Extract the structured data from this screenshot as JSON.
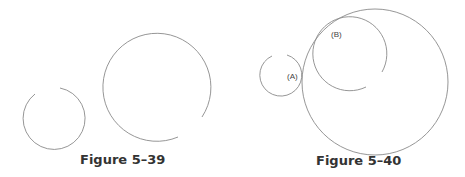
{
  "figures": [
    {
      "caption": "Figure 5–39"
    },
    {
      "caption": "Figure 5–40",
      "labels": {
        "a": "(A)",
        "b": "(B)"
      }
    }
  ],
  "colors": {
    "stroke": "#8a8a8a",
    "caption": "#333333"
  }
}
